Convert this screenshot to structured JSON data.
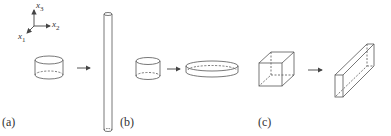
{
  "figure": {
    "axes": {
      "x1": "x",
      "x1_sub": "1",
      "x2": "x",
      "x2_sub": "2",
      "x3": "x",
      "x3_sub": "3"
    },
    "panels": [
      {
        "label": "(a)",
        "from": "cylinder",
        "to": "long thin rod"
      },
      {
        "label": "(b)",
        "from": "cylinder",
        "to": "flat disc"
      },
      {
        "label": "(c)",
        "from": "cube",
        "to": "elongated rectangular bar"
      }
    ],
    "colors": {
      "stroke": "#555555",
      "background": "#ffffff"
    }
  }
}
